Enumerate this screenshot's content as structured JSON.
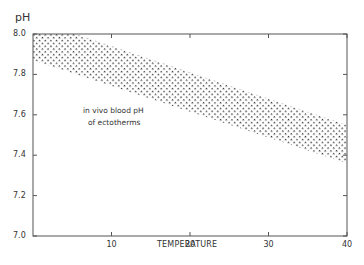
{
  "chart_data": {
    "type": "area",
    "title": "",
    "xlabel": "TEMPERATURE",
    "ylabel": "pH",
    "xlim": [
      0,
      40
    ],
    "ylim": [
      7.0,
      8.0
    ],
    "x_ticks": [
      10,
      20,
      30,
      40
    ],
    "y_ticks": [
      7.0,
      7.2,
      7.4,
      7.6,
      7.8,
      8.0
    ],
    "y_tick_labels": [
      "7.0",
      "7.2",
      "7.4",
      "7.6",
      "7.8",
      "8.0"
    ],
    "x_tick_labels": [
      "10",
      "20",
      "30",
      "40"
    ],
    "grid": false,
    "series": [
      {
        "name": "in vivo blood pH of ectotherms (band)",
        "x": [
          0,
          40
        ],
        "upper": [
          8.07,
          7.55
        ],
        "lower": [
          7.87,
          7.36
        ],
        "fill": "stippled"
      }
    ],
    "annotations": [
      "in vivo blood pH",
      "of ectotherms"
    ]
  },
  "labels": {
    "y_axis": "pH",
    "x_axis": "TEMPERATURE",
    "note_line1": "in vivo blood pH",
    "note_line2": "of ectotherms"
  }
}
